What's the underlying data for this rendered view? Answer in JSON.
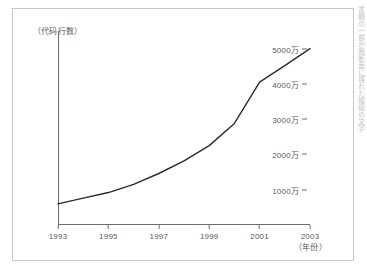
{
  "chart_data": {
    "type": "line",
    "title": "",
    "ylabel": "（代码行数）",
    "xlabel": "（年份）",
    "grid": false,
    "legend": false,
    "xlim": [
      1993,
      2003
    ],
    "ylim": [
      0,
      55000000
    ],
    "x_tick_labels": [
      "1993",
      "1995",
      "1997",
      "1999",
      "2001",
      "2003"
    ],
    "x_tick_values": [
      1993,
      1995,
      1997,
      1999,
      2001,
      2003
    ],
    "y_tick_labels": [
      "5000万",
      "4000万",
      "3000万",
      "2000万",
      "1000万"
    ],
    "y_tick_values": [
      50000000,
      40000000,
      30000000,
      20000000,
      10000000
    ],
    "series": [
      {
        "name": "代码行数",
        "color": "#2b2b2f",
        "x": [
          1993,
          1994,
          1995,
          1996,
          1997,
          1998,
          1999,
          2000,
          2001,
          2002,
          2003
        ],
        "values": [
          6000000,
          7600000,
          9200000,
          11500000,
          14600000,
          18200000,
          22500000,
          28800000,
          40500000,
          45200000,
          50000000
        ]
      }
    ]
  },
  "axes": {
    "y_ticks": [
      {
        "label": "5000万",
        "value": 50000000
      },
      {
        "label": "4000万",
        "value": 40000000
      },
      {
        "label": "3000万",
        "value": 30000000
      },
      {
        "label": "2000万",
        "value": 20000000
      },
      {
        "label": "1000万",
        "value": 10000000
      }
    ],
    "x_ticks": [
      {
        "label": "1993",
        "value": 1993
      },
      {
        "label": "1995",
        "value": 1995
      },
      {
        "label": "1997",
        "value": 1997
      },
      {
        "label": "1999",
        "value": 1999
      },
      {
        "label": "2001",
        "value": 2001
      },
      {
        "label": "2003",
        "value": 2003
      }
    ],
    "y_axis_title": "（代码行数）",
    "x_axis_title": "（年份）"
  },
  "margin": {
    "bleed_text": "書籍の一部が裁断面に現れた縦組の文字"
  }
}
